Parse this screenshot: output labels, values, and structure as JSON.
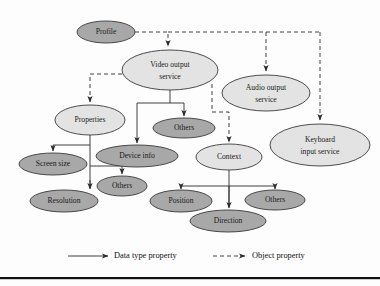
{
  "diagram": {
    "nodes": [
      {
        "id": "profile",
        "label": "Profile",
        "shade": "dark",
        "cx": 106,
        "cy": 32,
        "rx": 29,
        "ry": 11
      },
      {
        "id": "video",
        "label": "Video output service",
        "shade": "light",
        "cx": 170,
        "cy": 70,
        "rx": 48,
        "ry": 20,
        "lines": [
          "Video output",
          "service"
        ]
      },
      {
        "id": "audio",
        "label": "Audio output service",
        "shade": "light",
        "cx": 266,
        "cy": 93,
        "rx": 44,
        "ry": 18,
        "lines": [
          "Audio output",
          "service"
        ]
      },
      {
        "id": "keyboard",
        "label": "Keyboard input service",
        "shade": "light",
        "cx": 320,
        "cy": 145,
        "rx": 50,
        "ry": 21,
        "lines": [
          "Keyboard",
          "input service"
        ]
      },
      {
        "id": "properties",
        "label": "Properties",
        "shade": "light",
        "cx": 90,
        "cy": 120,
        "rx": 35,
        "ry": 15
      },
      {
        "id": "others1",
        "label": "Others",
        "shade": "dark",
        "cx": 184,
        "cy": 128,
        "rx": 31,
        "ry": 10
      },
      {
        "id": "deviceinfo",
        "label": "Device info",
        "shade": "dark",
        "cx": 137,
        "cy": 156,
        "rx": 41,
        "ry": 11
      },
      {
        "id": "context",
        "label": "Context",
        "shade": "light",
        "cx": 229,
        "cy": 157,
        "rx": 33,
        "ry": 13
      },
      {
        "id": "screensize",
        "label": "Screen size",
        "shade": "dark",
        "cx": 53,
        "cy": 164,
        "rx": 34,
        "ry": 11
      },
      {
        "id": "others2",
        "label": "Others",
        "shade": "dark",
        "cx": 122,
        "cy": 186,
        "rx": 25,
        "ry": 10
      },
      {
        "id": "resolution",
        "label": "Resolution",
        "shade": "dark",
        "cx": 64,
        "cy": 201,
        "rx": 34,
        "ry": 11
      },
      {
        "id": "position",
        "label": "Position",
        "shade": "dark",
        "cx": 181,
        "cy": 201,
        "rx": 31,
        "ry": 11
      },
      {
        "id": "others3",
        "label": "Others",
        "shade": "dark",
        "cx": 275,
        "cy": 200,
        "rx": 30,
        "ry": 10
      },
      {
        "id": "direction",
        "label": "Direction",
        "shade": "dark",
        "cx": 228,
        "cy": 221,
        "rx": 38,
        "ry": 11
      }
    ],
    "edges": [
      {
        "from": "profile",
        "to": "video",
        "type": "object"
      },
      {
        "from": "profile",
        "to": "audio",
        "type": "object"
      },
      {
        "from": "profile",
        "to": "keyboard",
        "type": "object"
      },
      {
        "from": "video",
        "to": "properties",
        "type": "object"
      },
      {
        "from": "video",
        "to": "context",
        "type": "object"
      },
      {
        "from": "video",
        "to": "deviceinfo",
        "type": "data"
      },
      {
        "from": "video",
        "to": "others1",
        "type": "data"
      },
      {
        "from": "properties",
        "to": "screensize",
        "type": "data"
      },
      {
        "from": "properties",
        "to": "others2",
        "type": "data"
      },
      {
        "from": "properties",
        "to": "resolution",
        "type": "data"
      },
      {
        "from": "context",
        "to": "position",
        "type": "data"
      },
      {
        "from": "context",
        "to": "direction",
        "type": "data"
      },
      {
        "from": "context",
        "to": "others3",
        "type": "data"
      }
    ],
    "legend": {
      "data_label": "Data type property",
      "object_label": "Object property"
    },
    "colors": {
      "node_dark": "#a8a8a8",
      "node_light": "#e3e3e3",
      "stroke": "#3a3a3a",
      "edge": "#2b2b2b",
      "text": "#1a1a1a",
      "background": "#fdfdfd"
    }
  }
}
